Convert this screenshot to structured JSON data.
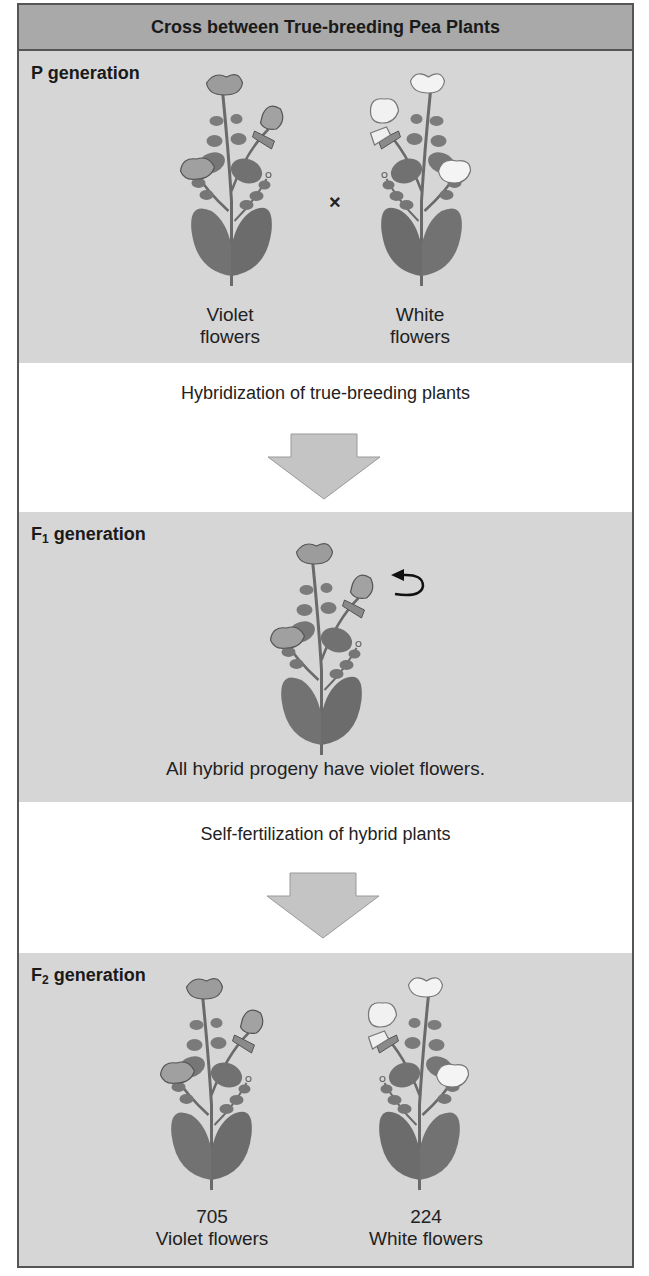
{
  "title": "Cross between True-breeding Pea Plants",
  "colors": {
    "header_bg": "#a9a9a9",
    "section_bg": "#d6d6d6",
    "band_bg": "#ffffff",
    "border": "#555555",
    "arrow_fill": "#c4c4c4",
    "violet_flower": "#9a9a9a",
    "white_flower": "#f2f2f2",
    "leaf": "#707070"
  },
  "sections": {
    "p": {
      "label_prefix": "P",
      "label_suffix": " generation",
      "plants": [
        {
          "flower_color": "violet",
          "caption_line1": "Violet",
          "caption_line2": "flowers"
        },
        {
          "flower_color": "white",
          "caption_line1": "White",
          "caption_line2": "flowers"
        }
      ],
      "cross_symbol": "×"
    },
    "step1": {
      "text": "Hybridization of true-breeding plants",
      "arrow_icon": "down-arrow"
    },
    "f1": {
      "label_prefix": "F",
      "label_sub": "1",
      "label_suffix": " generation",
      "plants": [
        {
          "flower_color": "violet"
        }
      ],
      "self_fertilize_icon": "curved-arrow",
      "caption": "All hybrid progeny have violet flowers."
    },
    "step2": {
      "text": "Self-fertilization of hybrid plants",
      "arrow_icon": "down-arrow"
    },
    "f2": {
      "label_prefix": "F",
      "label_sub": "2",
      "label_suffix": " generation",
      "plants": [
        {
          "flower_color": "violet",
          "count": "705",
          "caption": "Violet flowers"
        },
        {
          "flower_color": "white",
          "count": "224",
          "caption": "White flowers"
        }
      ]
    }
  }
}
